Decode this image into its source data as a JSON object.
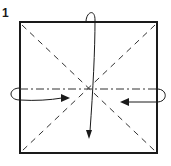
{
  "diagram": {
    "step_number": "1",
    "type": "origami-fold-diagram",
    "square": {
      "x": 20,
      "y": 22,
      "width": 137,
      "height": 131,
      "stroke": "#1a1a1a"
    },
    "lines": [
      {
        "kind": "valley-fold",
        "style": "dashed",
        "from": [
          20,
          22
        ],
        "to": [
          157,
          153
        ]
      },
      {
        "kind": "valley-fold",
        "style": "dashed",
        "from": [
          157,
          22
        ],
        "to": [
          20,
          153
        ]
      },
      {
        "kind": "mountain-fold",
        "style": "dash-dot",
        "from": [
          20,
          89
        ],
        "to": [
          157,
          89
        ]
      }
    ],
    "arrows": [
      {
        "name": "top-arrow",
        "direction": "down",
        "description": "fold top edge behind to bottom"
      },
      {
        "name": "left-arrow",
        "direction": "right",
        "description": "fold left corner to center"
      },
      {
        "name": "right-arrow",
        "direction": "left",
        "description": "fold right corner to center"
      }
    ],
    "colors": {
      "ink": "#1a1a1a",
      "background": "#ffffff"
    }
  }
}
